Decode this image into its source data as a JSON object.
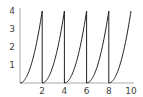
{
  "chart_data": {
    "type": "line",
    "title": "",
    "xlabel": "",
    "ylabel": "",
    "function": "y = (x mod 2)^2",
    "xlim": [
      0,
      10
    ],
    "ylim": [
      0,
      4
    ],
    "grid": false,
    "legend": null,
    "x_ticks": [
      2,
      4,
      6,
      8,
      10
    ],
    "y_ticks": [
      1,
      2,
      3,
      4
    ],
    "x_tick_labels": [
      "2",
      "4",
      "6",
      "8",
      "10"
    ],
    "y_tick_labels": [
      "1",
      "2",
      "3",
      "4"
    ],
    "series": [
      {
        "name": "sawtooth-square",
        "color": "#222222",
        "x": [
          0,
          0.5,
          1,
          1.5,
          2,
          2,
          2.5,
          3,
          3.5,
          4,
          4,
          4.5,
          5,
          5.5,
          6,
          6,
          6.5,
          7,
          7.5,
          8,
          8,
          8.5,
          9,
          9.5,
          10
        ],
        "y": [
          0,
          0.25,
          1,
          2.25,
          4,
          0,
          0.25,
          1,
          2.25,
          4,
          0,
          0.25,
          1,
          2.25,
          4,
          0,
          0.25,
          1,
          2.25,
          4,
          0,
          0.25,
          1,
          2.25,
          4
        ]
      }
    ],
    "axis_color": "#aaaaaa"
  }
}
